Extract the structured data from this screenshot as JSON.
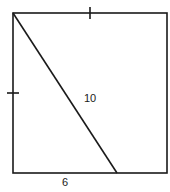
{
  "diagram": {
    "type": "geometry",
    "shape": "square",
    "labels": {
      "diagonal_segment": "10",
      "bottom_segment": "6"
    },
    "tick_marks": [
      "top-side",
      "left-side"
    ],
    "stroke_color": "#1a1a1a",
    "background": "#ffffff"
  }
}
